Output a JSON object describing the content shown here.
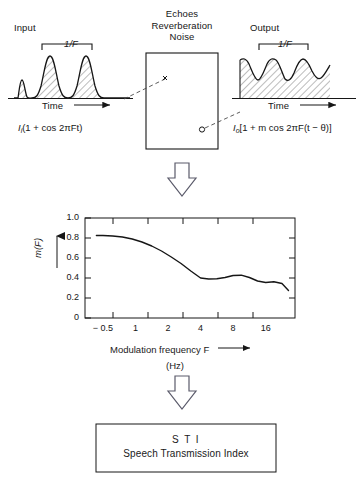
{
  "figure": {
    "headings": {
      "input": "Input",
      "output": "Output",
      "channel": "Echoes\nReverberation\nNoise"
    },
    "input_block": {
      "period_label": "1/F",
      "time_axis_label": "Time",
      "formula": "Iᵢ(1 + cos 2πFt)",
      "formula_parts": {
        "amplitude": "I",
        "amplitude_sub": "i",
        "body": "(1 + cos 2πFt)"
      }
    },
    "output_block": {
      "period_label": "1/F",
      "time_axis_label": "Time",
      "formula": "Iₒ[1 + m cos 2πF(t − θ)]",
      "formula_parts": {
        "amplitude": "I",
        "amplitude_sub": "o",
        "body": "[1 + m cos 2πF(t − θ)]"
      }
    },
    "sti_box": {
      "abbreviation": "S T I",
      "full_name": "Speech Transmission Index"
    },
    "colors": {
      "line": "#1a1a1a",
      "hatch": "#5c5c5c",
      "frame": "#1a1a1a",
      "background": "#ffffff"
    }
  },
  "chart_data": {
    "type": "line",
    "title": "",
    "xlabel": "Modulation frequency F",
    "xunit": "(Hz)",
    "ylabel": "m(F)",
    "xscale": "log2-like categorical",
    "xticklabels": [
      "− 0.5",
      "1",
      "2",
      "4",
      "8",
      "16"
    ],
    "xtickpositions": [
      1,
      2,
      3,
      4,
      5,
      6
    ],
    "yticklabels": [
      "0",
      "0.2",
      "0.4",
      "0.6",
      "0.8",
      "1.0"
    ],
    "ytickvalues": [
      0,
      0.2,
      0.4,
      0.6,
      0.8,
      1.0
    ],
    "ylim": [
      0,
      1.0
    ],
    "xlim": [
      0.45,
      6.9
    ],
    "grid": false,
    "legend": null,
    "series": [
      {
        "name": "m(F)",
        "x": [
          0.8,
          1.0,
          1.3,
          1.6,
          1.9,
          2.2,
          2.5,
          2.8,
          3.1,
          3.4,
          3.7,
          4.0,
          4.25,
          4.5,
          4.75,
          5.0,
          5.25,
          5.5,
          5.75,
          6.0,
          6.25,
          6.5,
          6.7
        ],
        "values": [
          0.825,
          0.825,
          0.82,
          0.81,
          0.79,
          0.76,
          0.72,
          0.67,
          0.61,
          0.545,
          0.47,
          0.4,
          0.39,
          0.392,
          0.405,
          0.425,
          0.428,
          0.405,
          0.37,
          0.355,
          0.362,
          0.345,
          0.275
        ]
      }
    ]
  }
}
